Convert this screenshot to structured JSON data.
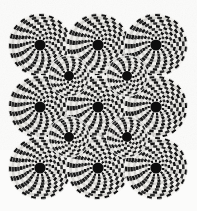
{
  "figure": {
    "title": "Rotating Snakes optical illusion",
    "type": "peripheral-drift-illusion"
  },
  "canvas": {
    "width": 197,
    "height": 211,
    "background_color": "#fbfbfa",
    "paper_tint": "#f4f3f1"
  },
  "palette": {
    "dark": "#111111",
    "light": "#f2f1ee",
    "mid_dark": "#2b2b2b",
    "mid_light": "#d8d7d3",
    "hub": "#0d0d0d",
    "gap": "#fbfbfa"
  },
  "layout": {
    "large_centers_x": [
      40,
      98,
      156
    ],
    "large_centers_y": [
      45,
      107,
      168
    ],
    "small_centers_x": [
      69,
      127
    ],
    "small_centers_y": [
      76,
      137
    ],
    "large_disc_count": 9,
    "small_disc_count": 4,
    "total_disc_count": 13
  },
  "large_disc": {
    "outer_radius": 31.5,
    "hub_radius": 5.6,
    "ring_count": 9,
    "base_cells": 22,
    "cell_growth": 2,
    "twist_per_ring": 7.5,
    "ring_gap": 0.35
  },
  "small_disc": {
    "outer_radius": 20.5,
    "hub_radius": 5.0,
    "ring_count": 6,
    "base_cells": 18,
    "cell_growth": 2,
    "twist_per_ring": -9.0,
    "ring_gap": 0.35
  },
  "render": {
    "draw_order": [
      "large-discs",
      "small-discs"
    ],
    "rim_stroke_color": "#fbfbfa",
    "rim_stroke_width": 0.8
  }
}
